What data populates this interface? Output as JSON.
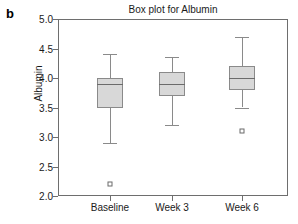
{
  "panel": {
    "letter": "b"
  },
  "chart_data": {
    "type": "box",
    "title": "Box plot for Albumin",
    "xlabel": "",
    "ylabel": "Albumin",
    "categories": [
      "Baseline",
      "Week 3",
      "Week 6"
    ],
    "ylim": [
      2.0,
      5.0
    ],
    "yticks": [
      "2.0",
      "2.5",
      "3.0",
      "3.5",
      "4.0",
      "4.5",
      "5.0"
    ],
    "ytick_values": [
      2.0,
      2.5,
      3.0,
      3.5,
      4.0,
      4.5,
      5.0
    ],
    "grid": false,
    "legend": "none",
    "boxes": [
      {
        "category": "Baseline",
        "whisker_low": 2.9,
        "q1": 3.5,
        "median": 3.9,
        "q3": 4.0,
        "whisker_high": 4.4,
        "outliers": [
          2.2
        ]
      },
      {
        "category": "Week 3",
        "whisker_low": 3.2,
        "q1": 3.7,
        "median": 3.9,
        "q3": 4.1,
        "whisker_high": 4.35,
        "outliers": []
      },
      {
        "category": "Week 6",
        "whisker_low": 3.5,
        "q1": 3.8,
        "median": 4.0,
        "q3": 4.2,
        "whisker_high": 4.7,
        "outliers": [
          3.1
        ]
      }
    ],
    "colors": {
      "box_fill": "#d8d8d8",
      "box_border": "#8a8a8a",
      "median": "#6b6b6b",
      "whisker": "#8a8a8a",
      "axis": "#6e6e6e",
      "text": "#1a1a1a"
    }
  }
}
